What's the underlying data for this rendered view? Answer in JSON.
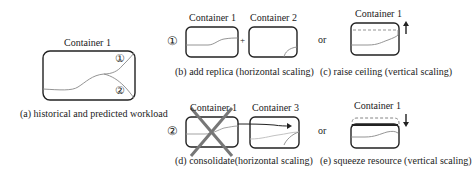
{
  "panel_a": {
    "title": "Container 1",
    "marker_1": "①",
    "marker_2": "②",
    "caption": "(a) historical and predicted workload"
  },
  "panel_b": {
    "row_marker": "①",
    "container_left": "Container 1",
    "container_right": "Container 2",
    "plus": "+",
    "caption": "(b) add replica (horizontal scaling)"
  },
  "panel_c": {
    "or": "or",
    "container": "Container 1",
    "arrow": "up",
    "caption": "(c) raise ceiling (vertical scaling)"
  },
  "panel_d": {
    "row_marker": "②",
    "container_left": "Container 1",
    "container_right": "Container 3",
    "caption": "(d) consolidate(horizontal scaling)"
  },
  "panel_e": {
    "or": "or",
    "container": "Container 1",
    "arrow": "down",
    "caption": "(e) squeeze resource (vertical scaling)"
  },
  "colors": {
    "box_stroke": "#222222",
    "curve": "#888888",
    "cross": "#777777"
  }
}
